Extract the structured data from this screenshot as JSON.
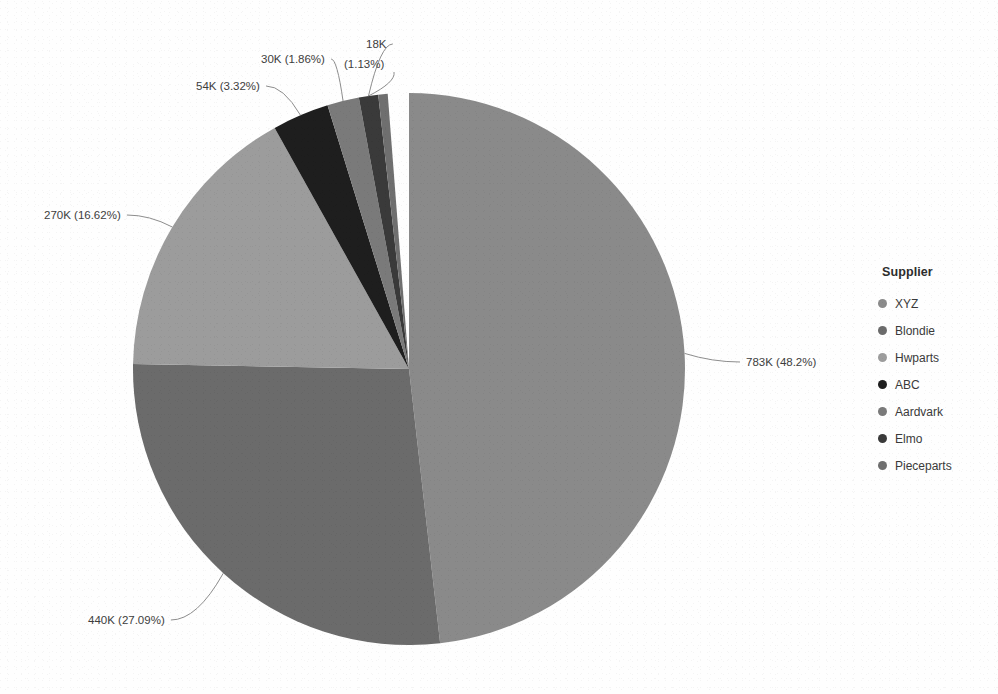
{
  "chart_data": {
    "type": "pie",
    "title": "",
    "legend_title": "Supplier",
    "legend_position": "right",
    "total": 1624000,
    "categories": [
      "XYZ",
      "Blondie",
      "Hwparts",
      "ABC",
      "Aardvark",
      "Elmo",
      "Pieceparts"
    ],
    "values": [
      783000,
      440000,
      270000,
      54000,
      30000,
      18000,
      9000
    ],
    "percentages": [
      48.2,
      27.09,
      16.62,
      3.32,
      1.86,
      1.13,
      0.55
    ],
    "value_labels": [
      "783K",
      "440K",
      "270K",
      "54K",
      "30K",
      "18K",
      ""
    ],
    "percent_labels": [
      "(48.2%)",
      "(27.09%)",
      "(16.62%)",
      "(3.32%)",
      "(1.86%)",
      "(1.13%)",
      ""
    ],
    "colors": [
      "#8a8a8a",
      "#6b6b6b",
      "#9c9c9c",
      "#1e1e1e",
      "#7a7a7a",
      "#3a3a3a",
      "#6f6f6f"
    ],
    "start_angle_deg": 0,
    "direction": "clockwise",
    "center": [
      409,
      369
    ],
    "radius": 276,
    "background": "#fefefe"
  },
  "callouts": [
    {
      "id": "xyz",
      "text": "783K (48.2%)",
      "x": 746,
      "y": 366
    },
    {
      "id": "blondie",
      "text": "440K (27.09%)",
      "x": 88,
      "y": 624
    },
    {
      "id": "hwparts",
      "text": "270K (16.62%)",
      "x": 44,
      "y": 219
    },
    {
      "id": "abc",
      "text": "54K (3.32%)",
      "x": 196,
      "y": 90
    },
    {
      "id": "aardvark",
      "text": "30K (1.86%)",
      "x": 261,
      "y": 63
    },
    {
      "id": "elmo-value",
      "text": "18K",
      "x": 366,
      "y": 48
    },
    {
      "id": "elmo-percent",
      "text": "(1.13%)",
      "x": 344,
      "y": 68
    }
  ],
  "legend": {
    "title": "Supplier",
    "items": [
      {
        "label": "XYZ",
        "color": "#8a8a8a"
      },
      {
        "label": "Blondie",
        "color": "#6b6b6b"
      },
      {
        "label": "Hwparts",
        "color": "#9c9c9c"
      },
      {
        "label": "ABC",
        "color": "#1e1e1e"
      },
      {
        "label": "Aardvark",
        "color": "#7a7a7a"
      },
      {
        "label": "Elmo",
        "color": "#3a3a3a"
      },
      {
        "label": "Pieceparts",
        "color": "#6f6f6f"
      }
    ]
  }
}
